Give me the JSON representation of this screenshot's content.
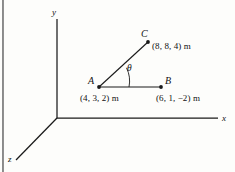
{
  "figure": {
    "type": "3d-coordinate-vector-diagram",
    "background_color": "#fdfdfb",
    "line_color": "#1a1a1a",
    "axes": {
      "x_label": "x",
      "y_label": "y",
      "z_label": "z",
      "origin_label": ""
    },
    "points": [
      {
        "name": "A",
        "label": "A",
        "coordinates_text": "(4, 3, 2) m",
        "x": 4,
        "y": 3,
        "z": 2,
        "unit": "m"
      },
      {
        "name": "B",
        "label": "B",
        "coordinates_text": "(6, 1, −2) m",
        "x": 6,
        "y": 1,
        "z": -2,
        "unit": "m"
      },
      {
        "name": "C",
        "label": "C",
        "coordinates_text": "(8, 8, 4) m",
        "x": 8,
        "y": 8,
        "z": 4,
        "unit": "m"
      }
    ],
    "angle": {
      "label": "θ",
      "between": "AC and AB"
    }
  }
}
